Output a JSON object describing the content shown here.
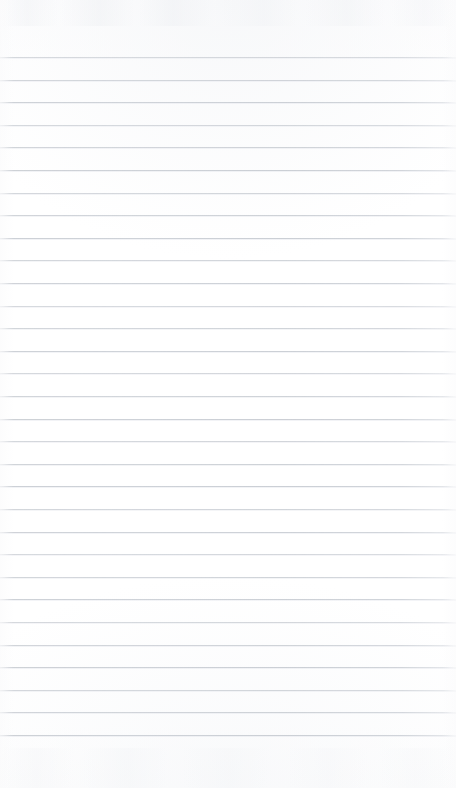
{
  "document": {
    "kind": "scanned-ruled-paper",
    "title": "Blank ruled notebook page",
    "text_content": "",
    "page_width": 456,
    "page_height": 788,
    "background_color": "#ffffff",
    "rule_color": "#ced2d8",
    "rule_thickness_px": 1,
    "rule_spacing_px": 22.6,
    "first_rule_y": 57,
    "last_rule_y": 734,
    "rule_count": 31,
    "top_margin_px": 57,
    "bottom_margin_px": 54,
    "left_margin_px": 0,
    "right_margin_px": 0,
    "rule_y_positions": [
      57,
      79.6,
      102.2,
      124.8,
      147.4,
      170,
      192.6,
      215.2,
      237.8,
      260.4,
      283,
      305.6,
      328.2,
      350.8,
      373.4,
      396,
      418.6,
      441.2,
      463.8,
      486.4,
      509,
      531.6,
      554.2,
      576.8,
      599.4,
      622,
      644.6,
      667.2,
      689.8,
      712.4,
      735
    ]
  }
}
